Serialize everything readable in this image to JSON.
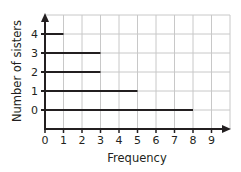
{
  "chart_data": {
    "type": "bar",
    "orientation": "horizontal",
    "title": "",
    "xlabel": "Frequency",
    "ylabel": "Number of sisters",
    "categories": [
      "0",
      "1",
      "2",
      "3",
      "4"
    ],
    "values": [
      8,
      5,
      3,
      3,
      1
    ],
    "xlim": [
      0,
      10
    ],
    "ylim": [
      -1,
      5
    ],
    "x_ticks": [
      "0",
      "1",
      "2",
      "3",
      "4",
      "5",
      "6",
      "7",
      "8",
      "9"
    ],
    "y_ticks": [
      "0",
      "1",
      "2",
      "3",
      "4"
    ],
    "grid": true,
    "legend": null,
    "style": "line bars (thin horizontal lines from y-axis)"
  },
  "colors": {
    "axis": "#231f20",
    "bar": "#231f20",
    "grid": "#c8c8c8",
    "background": "#ffffff"
  }
}
